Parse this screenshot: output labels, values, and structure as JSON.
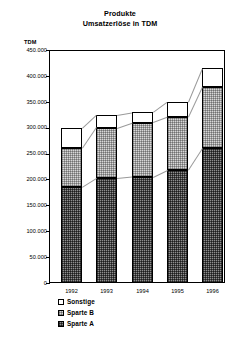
{
  "chart_data": {
    "type": "bar",
    "stacked": true,
    "title": "Produkte",
    "subtitle": "Umsatzerlöse in TDM",
    "unit_label": "TDM",
    "xlabel": "",
    "ylabel": "TDM",
    "categories": [
      "1992",
      "1993",
      "1994",
      "1995",
      "1996"
    ],
    "series": [
      {
        "name": "Sparte A",
        "values": [
          185000,
          202000,
          205000,
          218000,
          260000
        ],
        "fill": "dark-checker"
      },
      {
        "name": "Sparte B",
        "values": [
          75000,
          98000,
          105000,
          102000,
          118000
        ],
        "fill": "light-checker"
      },
      {
        "name": "Sonstige",
        "values": [
          40000,
          25000,
          20000,
          30000,
          37000
        ],
        "fill": "white"
      }
    ],
    "totals": [
      300000,
      325000,
      330000,
      350000,
      415000
    ],
    "ylim": [
      0,
      450000
    ],
    "ytick_values": [
      450000,
      400000,
      350000,
      300000,
      250000,
      200000,
      150000,
      100000,
      50000,
      0
    ],
    "ytick_labels": [
      "450.000",
      "400.000",
      "350.000",
      "300.000",
      "250.000",
      "200.000",
      "150.000",
      "100.000",
      "50.000",
      "0"
    ],
    "grid": false,
    "legend_position": "bottom-left",
    "legend": [
      {
        "label": "Sonstige",
        "swatch": "white"
      },
      {
        "label": "Sparte B",
        "swatch": "light-checker"
      },
      {
        "label": "Sparte A",
        "swatch": "dark-checker"
      }
    ],
    "colors": {
      "axis": "#000000",
      "sparte_a": "#8e8e8e",
      "sparte_b": "#d8d8d8",
      "sonstige": "#ffffff",
      "background": "#ffffff"
    }
  },
  "titles": {
    "line1": "Produkte",
    "line2": "Umsatzerlöse in TDM"
  },
  "axis": {
    "unit": "TDM"
  }
}
